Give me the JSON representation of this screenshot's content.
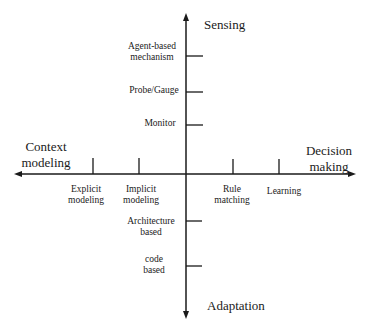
{
  "axes": {
    "top": "Sensing",
    "bottom": "Adaptation",
    "left": [
      "Context",
      "modeling"
    ],
    "right": [
      "Decision",
      "making"
    ]
  },
  "ticks": {
    "sensing": [
      {
        "lines": [
          "Agent-based",
          "mechanism"
        ]
      },
      {
        "lines": [
          "Probe/Gauge"
        ]
      },
      {
        "lines": [
          "Monitor"
        ]
      }
    ],
    "adaptation": [
      {
        "lines": [
          "Architecture",
          "based"
        ]
      },
      {
        "lines": [
          "code",
          "based"
        ]
      }
    ],
    "context_modeling": [
      {
        "lines": [
          "Explicit",
          "modeling"
        ]
      },
      {
        "lines": [
          "Implicit",
          "modeling"
        ]
      }
    ],
    "decision_making": [
      {
        "lines": [
          "Rule",
          "matching"
        ]
      },
      {
        "lines": [
          "Learning"
        ]
      }
    ]
  },
  "colors": {
    "line": "#1a1a1a",
    "background": "#ffffff"
  }
}
